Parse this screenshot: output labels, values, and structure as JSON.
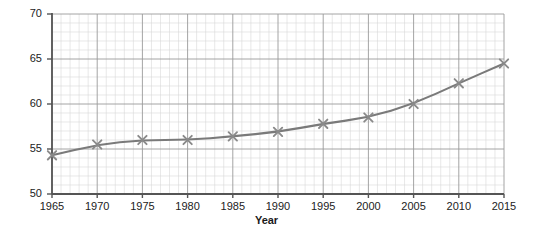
{
  "chart_data": {
    "type": "line",
    "title": "",
    "xlabel": "Year",
    "ylabel": "Population (millions)",
    "xlim": [
      1965,
      2015
    ],
    "ylim": [
      50,
      70
    ],
    "grid": true,
    "legend": "none",
    "x_major_ticks": [
      1965,
      1970,
      1975,
      1980,
      1985,
      1990,
      1995,
      2000,
      2005,
      2010,
      2015
    ],
    "y_major_ticks": [
      50,
      55,
      60,
      65,
      70
    ],
    "x_minor_step": 1,
    "y_minor_step": 1,
    "marker": "x",
    "line_color": "#7a7a7a",
    "marker_color": "#8a8a8a",
    "grid_major_color": "#9a9a9a",
    "grid_minor_color": "#d8d8d8",
    "axis_color": "#555555",
    "x": [
      1965,
      1970,
      1975,
      1980,
      1985,
      1990,
      1995,
      2000,
      2005,
      2010,
      2015
    ],
    "values": [
      54.3,
      55.5,
      56.0,
      56.0,
      56.4,
      56.9,
      57.8,
      58.5,
      60.0,
      62.3,
      64.5
    ],
    "series": [
      {
        "name": "Population",
        "values": [
          54.3,
          55.5,
          56.0,
          56.0,
          56.4,
          56.9,
          57.8,
          58.5,
          60.0,
          62.3,
          64.5
        ]
      }
    ]
  },
  "axes": {
    "y_title": "Population (millions)",
    "x_title": "Year",
    "y_tick_labels": [
      "70",
      "65",
      "60",
      "55",
      "50"
    ],
    "x_tick_labels": [
      "1965",
      "1970",
      "1975",
      "1980",
      "1985",
      "1990",
      "1995",
      "2000",
      "2005",
      "2010",
      "2015"
    ]
  }
}
